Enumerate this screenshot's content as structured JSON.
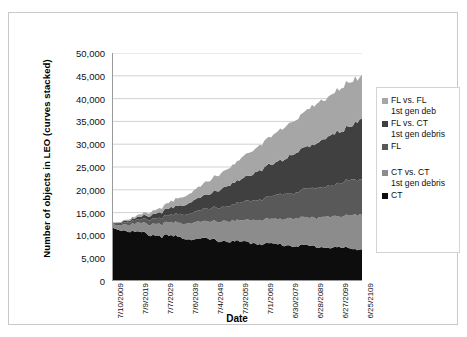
{
  "chart_data": {
    "type": "area",
    "stacked": true,
    "title": "",
    "xlabel": "Date",
    "ylabel": "Number of objects in LEO (curves stacked)",
    "ylim": [
      0,
      50000
    ],
    "ytick_step": 5000,
    "ytick_labels": [
      "50,000",
      "45,000",
      "40,000",
      "35,000",
      "30,000",
      "25,000",
      "20,000",
      "15,000",
      "10,000",
      "5,000",
      "0"
    ],
    "ytick_values": [
      50000,
      45000,
      40000,
      35000,
      30000,
      25000,
      20000,
      15000,
      10000,
      5000,
      0
    ],
    "grid": "horizontal",
    "legend_position": "right",
    "xtick_labels": [
      "7/10/2009",
      "7/9/2019",
      "7/7/2029",
      "7/6/2039",
      "7/4/2049",
      "7/3/2059",
      "7/1/2069",
      "6/30/2079",
      "6/28/2089",
      "6/27/2099",
      "6/25/2109"
    ],
    "x": [
      2009,
      2019,
      2029,
      2039,
      2049,
      2059,
      2069,
      2079,
      2089,
      2099,
      2109
    ],
    "series": [
      {
        "name": "CT",
        "color": "#0d0d0d",
        "order": 1,
        "values": [
          11800,
          10600,
          9900,
          9400,
          9000,
          8600,
          8200,
          7900,
          7600,
          7300,
          7000
        ]
      },
      {
        "name": "CT vs. CT 1st gen debris",
        "color": "#8c8c8c",
        "order": 2,
        "values": [
          700,
          1900,
          2700,
          3400,
          4000,
          4600,
          5200,
          5800,
          6300,
          6900,
          7500
        ]
      },
      {
        "name": "FL",
        "color": "#595959",
        "order": 3,
        "values": [
          200,
          700,
          1400,
          2100,
          2900,
          3700,
          4600,
          5500,
          6300,
          7100,
          8000
        ]
      },
      {
        "name": "FL vs. CT 1st gen debris",
        "color": "#404040",
        "order": 4,
        "values": [
          100,
          500,
          1200,
          2200,
          3400,
          4900,
          6400,
          8000,
          9600,
          11200,
          12800
        ]
      },
      {
        "name": "FL vs. FL 1st gen deb",
        "color": "#a6a6a6",
        "order": 5,
        "values": [
          100,
          400,
          1000,
          1900,
          3000,
          4300,
          5700,
          7000,
          8300,
          9300,
          9700
        ]
      }
    ],
    "totals": [
      12900,
      14100,
      16200,
      19000,
      22300,
      26100,
      30100,
      34200,
      38100,
      41800,
      45000
    ]
  },
  "legend": {
    "items": [
      {
        "label": "FL vs. FL 1st gen deb",
        "color": "#a6a6a6",
        "blank": false
      },
      {
        "label": "FL vs. CT 1st gen debris",
        "color": "#404040",
        "blank": false
      },
      {
        "label": "FL",
        "color": "#595959",
        "blank": false
      },
      {
        "label": "",
        "color": "",
        "blank": true
      },
      {
        "label": "CT vs. CT 1st gen debris",
        "color": "#8c8c8c",
        "blank": false
      },
      {
        "label": "CT",
        "color": "#0d0d0d",
        "blank": false
      }
    ]
  },
  "axes": {
    "x_title": "Date",
    "y_title": "Number of objects in LEO (curves stacked)"
  }
}
